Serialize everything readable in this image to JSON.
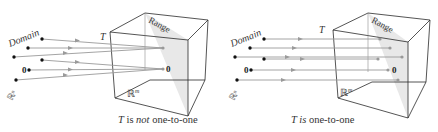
{
  "panels": [
    {
      "id": "not-one-to-one",
      "caption": {
        "T": "T",
        "is": " is ",
        "not": "not",
        "rest": " one-to-one"
      },
      "labels": {
        "domain": "Domain",
        "range": "Range",
        "map": "T",
        "rn": "ℝⁿ",
        "rm": "ℝ",
        "rm_sup": "m",
        "zero_domain": "0",
        "zero_range": "0"
      }
    },
    {
      "id": "one-to-one",
      "caption": {
        "T": "T",
        "is": " is",
        "rest": " one-to-one"
      },
      "labels": {
        "domain": "Domain",
        "range": "Range",
        "map": "T",
        "rn": "ℝⁿ",
        "rm": "ℝ",
        "rm_sup": "m",
        "zero_domain": "0",
        "zero_range": "0"
      }
    }
  ],
  "colors": {
    "line": "#222222",
    "arrow": "#9a9a9a",
    "plane": "#e6e6e6",
    "dot": "#111111",
    "target": "#999999"
  }
}
